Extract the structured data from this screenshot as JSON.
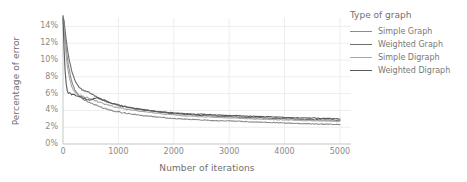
{
  "chart_data": {
    "type": "line",
    "title": "",
    "xlabel": "Number of iterations",
    "ylabel": "Percentage of error",
    "xlim": [
      0,
      5200
    ],
    "ylim": [
      0,
      15
    ],
    "xticks": [
      0,
      1000,
      2000,
      3000,
      4000,
      5000
    ],
    "xtick_labels": [
      "0",
      "1000",
      "2000",
      "3000",
      "4000",
      "5000"
    ],
    "yticks": [
      0,
      2,
      4,
      6,
      8,
      10,
      12,
      14
    ],
    "ytick_labels": [
      "0%",
      "2%",
      "4%",
      "6%",
      "8%",
      "10%",
      "12%",
      "14%"
    ],
    "grid": true,
    "legend_position": "right",
    "legend_title": "Type of graph",
    "series": [
      {
        "name": "Simple Graph",
        "color": "#8c8c8c",
        "x": [
          0,
          20,
          40,
          60,
          80,
          100,
          120,
          150,
          180,
          220,
          260,
          300,
          350,
          400,
          450,
          500,
          560,
          620,
          700,
          780,
          860,
          950,
          1050,
          1150,
          1300,
          1450,
          1600,
          1800,
          2000,
          2200,
          2400,
          2600,
          2800,
          3000,
          3250,
          3500,
          3750,
          4000,
          4250,
          4500,
          4750,
          5000
        ],
        "y": [
          15.2,
          14.2,
          12.6,
          11.2,
          10.1,
          9.3,
          8.6,
          7.6,
          7.0,
          6.4,
          6.0,
          5.7,
          5.4,
          5.2,
          5.0,
          4.9,
          4.7,
          4.55,
          4.35,
          4.2,
          4.05,
          3.9,
          3.78,
          3.66,
          3.5,
          3.38,
          3.28,
          3.15,
          3.04,
          2.96,
          2.9,
          2.84,
          2.78,
          2.74,
          2.68,
          2.62,
          2.56,
          2.5,
          2.45,
          2.4,
          2.36,
          2.32
        ]
      },
      {
        "name": "Weighted Graph",
        "color": "#6e6e6e",
        "x": [
          0,
          20,
          40,
          60,
          80,
          100,
          120,
          150,
          180,
          220,
          260,
          300,
          350,
          400,
          450,
          500,
          560,
          620,
          700,
          780,
          860,
          950,
          1050,
          1150,
          1300,
          1450,
          1600,
          1800,
          2000,
          2200,
          2400,
          2600,
          2800,
          3000,
          3250,
          3500,
          3750,
          4000,
          4250,
          4500,
          4750,
          5000
        ],
        "y": [
          15.3,
          14.6,
          13.4,
          12.3,
          11.3,
          10.5,
          9.8,
          8.9,
          8.2,
          7.5,
          7.0,
          6.7,
          6.4,
          6.3,
          6.2,
          6.0,
          5.8,
          5.6,
          5.3,
          5.1,
          4.9,
          4.7,
          4.55,
          4.4,
          4.2,
          4.05,
          3.92,
          3.76,
          3.62,
          3.52,
          3.44,
          3.37,
          3.3,
          3.25,
          3.18,
          3.12,
          3.06,
          3.0,
          2.95,
          2.9,
          2.86,
          2.82
        ]
      },
      {
        "name": "Simple Digraph",
        "color": "#a8a8a8",
        "x": [
          0,
          20,
          40,
          60,
          80,
          100,
          120,
          150,
          180,
          220,
          260,
          300,
          350,
          400,
          450,
          500,
          560,
          620,
          700,
          780,
          860,
          950,
          1050,
          1150,
          1300,
          1450,
          1600,
          1800,
          2000,
          2200,
          2400,
          2600,
          2800,
          3000,
          3250,
          3500,
          3750,
          4000,
          4250,
          4500,
          4750,
          5000
        ],
        "y": [
          15.1,
          13.6,
          11.8,
          10.3,
          9.2,
          8.4,
          7.8,
          7.0,
          6.5,
          6.1,
          5.9,
          5.8,
          5.7,
          5.6,
          5.5,
          5.4,
          5.2,
          5.05,
          4.85,
          4.7,
          4.55,
          4.4,
          4.28,
          4.15,
          3.98,
          3.85,
          3.74,
          3.58,
          3.45,
          3.36,
          3.28,
          3.22,
          3.16,
          3.11,
          3.04,
          2.98,
          2.92,
          2.87,
          2.82,
          2.78,
          2.74,
          2.7
        ]
      },
      {
        "name": "Weighted Digraph",
        "color": "#5a5a5a",
        "x": [
          0,
          20,
          40,
          60,
          80,
          100,
          120,
          150,
          180,
          220,
          260,
          300,
          350,
          400,
          450,
          500,
          560,
          620,
          700,
          780,
          860,
          950,
          1050,
          1150,
          1300,
          1450,
          1600,
          1800,
          2000,
          2200,
          2400,
          2600,
          2800,
          3000,
          3250,
          3500,
          3750,
          4000,
          4250,
          4500,
          4750,
          5000
        ],
        "y": [
          15.0,
          11.2,
          8.4,
          7.0,
          6.3,
          6.0,
          6.1,
          5.9,
          6.0,
          5.8,
          5.7,
          5.65,
          5.5,
          5.4,
          5.3,
          5.2,
          5.4,
          5.5,
          5.3,
          5.1,
          4.9,
          4.7,
          4.55,
          4.42,
          4.25,
          4.1,
          3.98,
          3.82,
          3.7,
          3.62,
          3.56,
          3.5,
          3.45,
          3.4,
          3.34,
          3.28,
          3.22,
          3.17,
          3.12,
          3.08,
          3.04,
          3.0
        ]
      }
    ]
  }
}
